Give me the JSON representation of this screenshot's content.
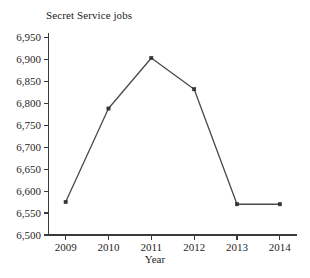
{
  "chart_data": {
    "type": "line",
    "title": "Secret Service jobs",
    "xlabel": "Year",
    "ylabel": "",
    "categories": [
      "2009",
      "2010",
      "2011",
      "2012",
      "2013",
      "2014"
    ],
    "x": [
      2009,
      2010,
      2011,
      2012,
      2013,
      2014
    ],
    "values": [
      6575,
      6788,
      6903,
      6832,
      6570,
      6570
    ],
    "series": [
      {
        "name": "Secret Service jobs",
        "values": [
          6575,
          6788,
          6903,
          6832,
          6570,
          6570
        ]
      }
    ],
    "ylim": [
      6500,
      6960
    ],
    "xlim": [
      2008.6,
      2014.4
    ],
    "y_ticks": [
      6500,
      6550,
      6600,
      6650,
      6700,
      6750,
      6800,
      6850,
      6900,
      6950
    ],
    "y_tick_labels": [
      "6,500",
      "6,550",
      "6,600",
      "6,650",
      "6,700",
      "6,750",
      "6,800",
      "6,850",
      "6,900",
      "6,950"
    ],
    "x_ticks": [
      2009,
      2010,
      2011,
      2012,
      2013,
      2014
    ],
    "x_tick_labels": [
      "2009",
      "2010",
      "2011",
      "2012",
      "2013",
      "2014"
    ],
    "grid": false,
    "legend": "none",
    "marker": "square",
    "line_color": "#4a4a4a",
    "marker_color": "#333333",
    "axis_color": "#3a3a3a",
    "background_color": "#ffffff"
  },
  "labels": {
    "title": "Secret Service jobs",
    "xaxis_title": "Year"
  }
}
